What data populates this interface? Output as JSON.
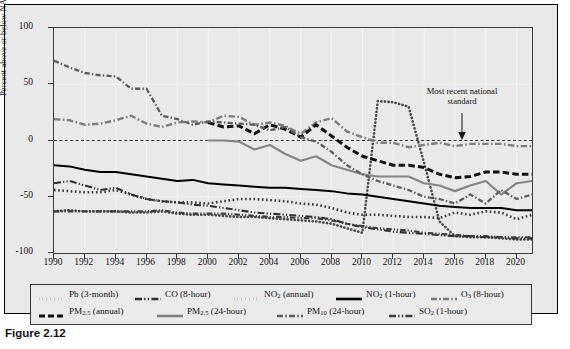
{
  "figure": {
    "caption": "Figure 2.12",
    "annotation_line1": "Most recent national",
    "annotation_line2": "standard"
  },
  "axes": {
    "ylabel": "Percent above or below NAAQS (%)",
    "yticks": [
      "100",
      "50",
      "0",
      "-50",
      "-100"
    ],
    "ytick_values": [
      100,
      50,
      0,
      -50,
      -100
    ],
    "xticks": [
      "1990",
      "1992",
      "1994",
      "1996",
      "1998",
      "2000",
      "2002",
      "2004",
      "2006",
      "2008",
      "2010",
      "2012",
      "2014",
      "2016",
      "2018",
      "2020"
    ],
    "xlim": [
      1990,
      2021
    ],
    "ylim": [
      -100,
      100
    ]
  },
  "legend": {
    "row1": [
      {
        "label": "Pb (3-month)",
        "style": "dotted-square",
        "color": "#4a4a4a"
      },
      {
        "label": "CO (8-hour)",
        "style": "dash-dot-dot",
        "color": "#2e2e2e"
      },
      {
        "label": "NO2 (annual)",
        "label_base": "NO",
        "label_sub": "2",
        "label_rest": " (annual)",
        "style": "dotted-square",
        "color": "#3a3a3a"
      },
      {
        "label": "NO2 (1-hour)",
        "label_base": "NO",
        "label_sub": "2",
        "label_rest": " (1-hour)",
        "style": "solid",
        "color": "#000000"
      },
      {
        "label": "O3 (8-hour)",
        "label_base": "O",
        "label_sub": "3",
        "label_rest": " (8-hour)",
        "style": "dash-dot",
        "color": "#7a7a7a"
      }
    ],
    "row2": [
      {
        "label": "PM2.5 (annual)",
        "label_base": "PM",
        "label_sub": "2.5",
        "label_rest": " (annual)",
        "style": "dashed-thick",
        "color": "#101010"
      },
      {
        "label": "PM2.5 (24-hour)",
        "label_base": "PM",
        "label_sub": "2.5",
        "label_rest": " (24-hour)",
        "style": "solid-gray",
        "color": "#808080"
      },
      {
        "label": "PM10 (24-hour)",
        "label_base": "PM",
        "label_sub": "10",
        "label_rest": " (24-hour)",
        "style": "dash-dot",
        "color": "#5a5a5a"
      },
      {
        "label": "SO2 (1-hour)",
        "label_base": "SO",
        "label_sub": "2",
        "label_rest": " (1-hour)",
        "style": "dash-dot-dot",
        "color": "#3c3c3c"
      }
    ]
  },
  "chart_data": {
    "type": "line",
    "title": "",
    "xlabel": "",
    "ylabel": "Percent above or below NAAQS (%)",
    "xlim": [
      1990,
      2021
    ],
    "ylim": [
      -100,
      100
    ],
    "grid": true,
    "legend_position": "below-plot",
    "annotations": [
      {
        "text": "Most recent national standard",
        "x": 2016,
        "y": 48,
        "arrow_to_y": 0
      }
    ],
    "x": [
      1990,
      1991,
      1992,
      1993,
      1994,
      1995,
      1996,
      1997,
      1998,
      1999,
      2000,
      2001,
      2002,
      2003,
      2004,
      2005,
      2006,
      2007,
      2008,
      2009,
      2010,
      2011,
      2012,
      2013,
      2014,
      2015,
      2016,
      2017,
      2018,
      2019,
      2020,
      2021
    ],
    "series": [
      {
        "name": "Pb (3-month)",
        "values": [
          -63,
          -62,
          -63,
          -63,
          -63,
          -64,
          -64,
          -63,
          -65,
          -66,
          -66,
          -67,
          -68,
          -68,
          -69,
          -70,
          -71,
          -72,
          -74,
          -78,
          -82,
          35,
          34,
          30,
          -20,
          -72,
          -85,
          -86,
          -86,
          -87,
          -88,
          -88
        ]
      },
      {
        "name": "CO (8-hour)",
        "values": [
          -38,
          -36,
          -40,
          -44,
          -42,
          -48,
          -52,
          -54,
          -55,
          -57,
          -58,
          -60,
          -62,
          -64,
          -65,
          -66,
          -67,
          -68,
          -70,
          -74,
          -77,
          -79,
          -81,
          -82,
          -83,
          -84,
          -85,
          -85,
          -86,
          -86,
          -87,
          -87
        ]
      },
      {
        "name": "NO2 (annual)",
        "values": [
          -44,
          -45,
          -46,
          -46,
          -44,
          -48,
          -52,
          -54,
          -55,
          -55,
          -56,
          -54,
          -52,
          -52,
          -53,
          -54,
          -56,
          -57,
          -60,
          -64,
          -66,
          -66,
          -67,
          -68,
          -68,
          -69,
          -64,
          -66,
          -63,
          -64,
          -70,
          -66
        ]
      },
      {
        "name": "NO2 (1-hour)",
        "values": [
          -22,
          -23,
          -26,
          -28,
          -28,
          -30,
          -32,
          -34,
          -36,
          -35,
          -38,
          -39,
          -40,
          -41,
          -42,
          -42,
          -43,
          -44,
          -45,
          -47,
          -48,
          -50,
          -52,
          -54,
          -56,
          -58,
          -59,
          -60,
          -60,
          -60,
          -62,
          -62
        ]
      },
      {
        "name": "O3 (8-hour)",
        "values": [
          19,
          18,
          14,
          15,
          18,
          22,
          15,
          12,
          16,
          17,
          16,
          22,
          21,
          14,
          16,
          13,
          6,
          16,
          20,
          8,
          3,
          -2,
          -2,
          -6,
          -4,
          -2,
          -5,
          -3,
          -3,
          -3,
          -5,
          -5
        ]
      },
      {
        "name": "PM2.5 (annual)",
        "values": [
          null,
          null,
          null,
          null,
          null,
          null,
          null,
          null,
          null,
          null,
          16,
          12,
          13,
          6,
          14,
          10,
          3,
          14,
          4,
          -6,
          -14,
          -18,
          -22,
          -22,
          -24,
          -30,
          -33,
          -32,
          -28,
          -28,
          -30,
          -30
        ]
      },
      {
        "name": "PM2.5 (24-hour)",
        "values": [
          null,
          null,
          null,
          null,
          null,
          null,
          null,
          null,
          null,
          null,
          0,
          0,
          -1,
          -8,
          -4,
          -12,
          -18,
          -14,
          -22,
          -26,
          -30,
          -32,
          -32,
          -32,
          -38,
          -40,
          -45,
          -40,
          -36,
          -48,
          -38,
          -36
        ]
      },
      {
        "name": "PM10 (24-hour)",
        "values": [
          71,
          65,
          60,
          58,
          57,
          46,
          46,
          22,
          19,
          14,
          17,
          16,
          15,
          14,
          9,
          12,
          3,
          -1,
          -10,
          -22,
          -30,
          -36,
          -40,
          -44,
          -50,
          -52,
          -56,
          -48,
          -56,
          -44,
          -52,
          -48
        ]
      },
      {
        "name": "SO2 (1-hour)",
        "values": [
          -63,
          -63,
          -63,
          -63,
          -63,
          -63,
          -63,
          -62,
          -64,
          -65,
          -65,
          -65,
          -66,
          -67,
          -68,
          -68,
          -69,
          -69,
          -71,
          -74,
          -76,
          -78,
          -79,
          -80,
          -82,
          -83,
          -84,
          -85,
          -85,
          -86,
          -86,
          -86
        ]
      }
    ]
  }
}
